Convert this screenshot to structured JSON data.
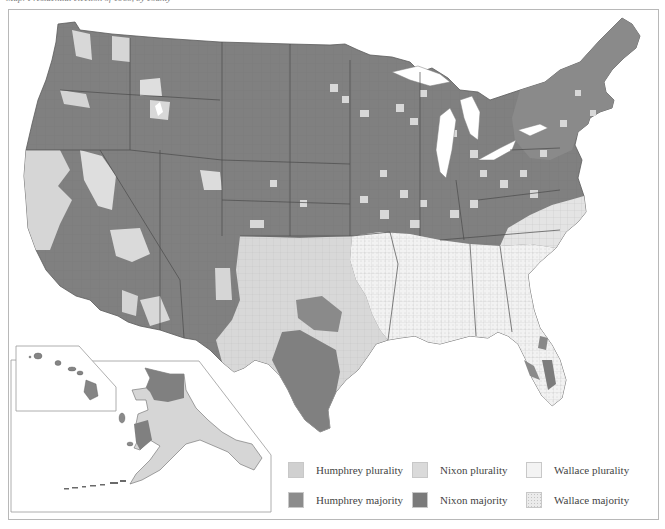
{
  "caption": "Map: Presidential election of 1968, by county",
  "map": {
    "title": "1968 U.S. Presidential Election Results by County",
    "region": "United States (counties)",
    "insets": [
      "Alaska",
      "Hawaii"
    ],
    "colors": {
      "humphrey_plurality": "#d2d2d2",
      "humphrey_majority": "#8e8e8e",
      "nixon_plurality": "#dcdcdc",
      "nixon_majority": "#7a7a7a",
      "wallace_plurality": "#f4f4f4",
      "wallace_majority": "#ececec",
      "border": "#555555",
      "background": "#ffffff"
    }
  },
  "legend": {
    "items": [
      {
        "key": "humphrey_plurality",
        "label": "Humphrey plurality",
        "color": "#d0d0d0"
      },
      {
        "key": "nixon_plurality",
        "label": "Nixon plurality",
        "color": "#dadada"
      },
      {
        "key": "wallace_plurality",
        "label": "Wallace plurality",
        "color": "#f3f3f3"
      },
      {
        "key": "humphrey_majority",
        "label": "Humphrey majority",
        "color": "#8c8c8c"
      },
      {
        "key": "nixon_majority",
        "label": "Nixon majority",
        "color": "#7b7b7b"
      },
      {
        "key": "wallace_majority",
        "label": "Wallace majority",
        "color": "#ebebeb"
      }
    ]
  }
}
